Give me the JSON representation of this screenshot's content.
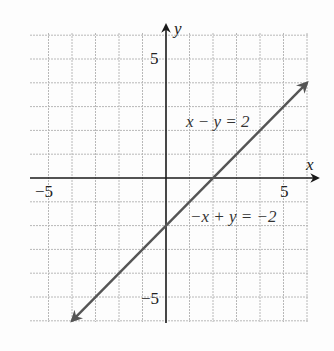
{
  "chart_data": {
    "type": "line",
    "title": "",
    "xlabel": "x",
    "ylabel": "y",
    "xlim": [
      -5.8,
      6
    ],
    "ylim": [
      -6,
      6
    ],
    "grid": true,
    "grid_step": 1,
    "x_tick_labels": [
      "-5",
      "5"
    ],
    "y_tick_labels": [
      "5",
      "-5"
    ],
    "series": [
      {
        "name": "x − y = 2",
        "equation_alt": "−x + y = −2",
        "x": [
          -4,
          6
        ],
        "y": [
          -6,
          4
        ],
        "arrows": "both"
      }
    ],
    "annotations": [
      {
        "text": "x − y = 2",
        "x": 2.6,
        "y": 2.6
      },
      {
        "text": "−x + y = −2",
        "x": 3.4,
        "y": -1.3
      }
    ]
  },
  "labels": {
    "x_axis": "x",
    "y_axis": "y",
    "x_neg5": "−5",
    "x_pos5": "5",
    "y_pos5": "5",
    "y_neg5": "−5",
    "eq1": "x − y = 2",
    "eq2": "−x + y = −2"
  },
  "colors": {
    "line": "#555555",
    "axis": "#1a1a1a",
    "grid": "#b8b8b8"
  }
}
